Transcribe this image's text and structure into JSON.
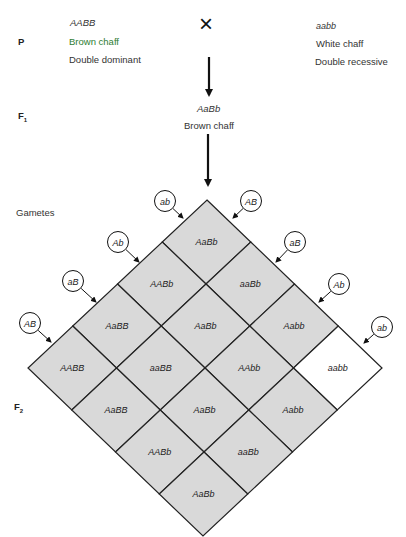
{
  "generations": {
    "P": "P",
    "F1": "F",
    "F1_sub": "1",
    "gametes": "Gametes",
    "F2": "F",
    "F2_sub": "2"
  },
  "parents": {
    "left": {
      "genotype": "AABB",
      "phenotype": "Brown chaff",
      "description": "Double dominant"
    },
    "cross_symbol": "×",
    "right": {
      "genotype": "aabb",
      "phenotype": "White chaff",
      "description": "Double recessive"
    }
  },
  "f1": {
    "genotype": "AaBb",
    "phenotype": "Brown chaff"
  },
  "gametes": {
    "left_side": [
      "ab",
      "Ab",
      "aB",
      "AB"
    ],
    "right_side": [
      "AB",
      "aB",
      "Ab",
      "ab"
    ]
  },
  "punnett": {
    "cells": [
      [
        "AaBb",
        "aaBb",
        "Aabb",
        "aabb"
      ],
      [
        "AABb",
        "AaBb",
        "AAbb",
        "Aabb"
      ],
      [
        "AaBB",
        "aaBB",
        "AaBb",
        "aaBb"
      ],
      [
        "AABB",
        "AaBB",
        "AABb",
        "AaBb"
      ]
    ],
    "white_cell": "aabb"
  },
  "colors": {
    "cell_fill": "#d9d9d9",
    "white_cell_fill": "#ffffff",
    "line": "#222222",
    "brown_label": "#2e7d32"
  }
}
